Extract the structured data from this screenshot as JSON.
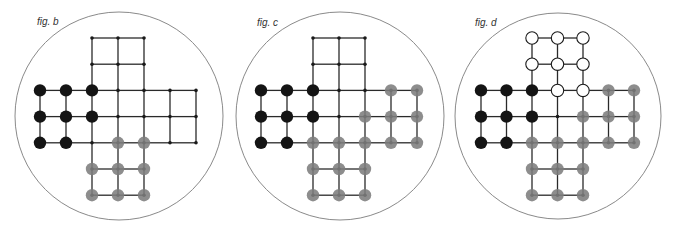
{
  "colors": {
    "background": "#ffffff",
    "circle_outline": "#8a8a8a",
    "line": "#2a2a2a",
    "black_peg": "#141414",
    "gray_peg": "#7d7d7d",
    "white_peg_fill": "#ffffff",
    "white_peg_stroke": "#1a1a1a"
  },
  "board": {
    "description": "Cross-shaped board: 3x3 center plus four 3x2 arms (top, left, right, bottom), each cell point indexed by column c (0-6) and row r (0-6)",
    "points": [
      [
        2,
        0
      ],
      [
        3,
        0
      ],
      [
        4,
        0
      ],
      [
        2,
        1
      ],
      [
        3,
        1
      ],
      [
        4,
        1
      ],
      [
        0,
        2
      ],
      [
        1,
        2
      ],
      [
        2,
        2
      ],
      [
        3,
        2
      ],
      [
        4,
        2
      ],
      [
        5,
        2
      ],
      [
        6,
        2
      ],
      [
        0,
        3
      ],
      [
        1,
        3
      ],
      [
        2,
        3
      ],
      [
        3,
        3
      ],
      [
        4,
        3
      ],
      [
        5,
        3
      ],
      [
        6,
        3
      ],
      [
        0,
        4
      ],
      [
        1,
        4
      ],
      [
        2,
        4
      ],
      [
        3,
        4
      ],
      [
        4,
        4
      ],
      [
        5,
        4
      ],
      [
        6,
        4
      ],
      [
        2,
        5
      ],
      [
        3,
        5
      ],
      [
        4,
        5
      ],
      [
        2,
        6
      ],
      [
        3,
        6
      ],
      [
        4,
        6
      ]
    ]
  },
  "figures": [
    {
      "id": "b",
      "label": "fig. b",
      "circle": {
        "cx": 119,
        "cy": 116,
        "r": 104
      },
      "label_pos": {
        "x": 37,
        "y": 25
      },
      "grid": {
        "x0": 40,
        "y0": 38,
        "dx": 26,
        "dy": 26.2
      },
      "pegs": {
        "black": [
          [
            0,
            2
          ],
          [
            1,
            2
          ],
          [
            2,
            2
          ],
          [
            0,
            3
          ],
          [
            1,
            3
          ],
          [
            2,
            3
          ],
          [
            0,
            4
          ],
          [
            1,
            4
          ]
        ],
        "gray": [
          [
            3,
            4
          ],
          [
            4,
            4
          ],
          [
            2,
            5
          ],
          [
            3,
            5
          ],
          [
            4,
            5
          ],
          [
            2,
            6
          ],
          [
            3,
            6
          ],
          [
            4,
            6
          ]
        ],
        "white": []
      }
    },
    {
      "id": "c",
      "label": "fig. c",
      "circle": {
        "cx": 340,
        "cy": 116,
        "r": 104
      },
      "label_pos": {
        "x": 257,
        "y": 26
      },
      "grid": {
        "x0": 261,
        "y0": 38,
        "dx": 26,
        "dy": 26.2
      },
      "pegs": {
        "black": [
          [
            0,
            2
          ],
          [
            1,
            2
          ],
          [
            2,
            2
          ],
          [
            0,
            3
          ],
          [
            1,
            3
          ],
          [
            2,
            3
          ],
          [
            0,
            4
          ],
          [
            1,
            4
          ]
        ],
        "gray": [
          [
            2,
            4
          ],
          [
            3,
            4
          ],
          [
            2,
            5
          ],
          [
            3,
            5
          ],
          [
            4,
            5
          ],
          [
            2,
            6
          ],
          [
            3,
            6
          ],
          [
            4,
            6
          ],
          [
            5,
            2
          ],
          [
            6,
            2
          ],
          [
            4,
            3
          ],
          [
            5,
            3
          ],
          [
            6,
            3
          ],
          [
            4,
            4
          ],
          [
            5,
            4
          ],
          [
            6,
            4
          ]
        ],
        "white": []
      }
    },
    {
      "id": "d",
      "label": "fig. d",
      "circle": {
        "cx": 558,
        "cy": 116,
        "r": 103
      },
      "label_pos": {
        "x": 475,
        "y": 26
      },
      "grid": {
        "x0": 481,
        "y0": 38,
        "dx": 25.5,
        "dy": 26.2
      },
      "pegs": {
        "black": [
          [
            0,
            2
          ],
          [
            1,
            2
          ],
          [
            2,
            2
          ],
          [
            0,
            3
          ],
          [
            1,
            3
          ],
          [
            2,
            3
          ],
          [
            0,
            4
          ],
          [
            1,
            4
          ]
        ],
        "gray": [
          [
            2,
            4
          ],
          [
            3,
            4
          ],
          [
            2,
            5
          ],
          [
            3,
            5
          ],
          [
            4,
            5
          ],
          [
            2,
            6
          ],
          [
            3,
            6
          ],
          [
            4,
            6
          ],
          [
            5,
            2
          ],
          [
            6,
            2
          ],
          [
            4,
            3
          ],
          [
            5,
            3
          ],
          [
            6,
            3
          ],
          [
            4,
            4
          ],
          [
            5,
            4
          ],
          [
            6,
            4
          ]
        ],
        "white": [
          [
            2,
            0
          ],
          [
            3,
            0
          ],
          [
            4,
            0
          ],
          [
            2,
            1
          ],
          [
            3,
            1
          ],
          [
            4,
            1
          ],
          [
            3,
            2
          ],
          [
            4,
            2
          ]
        ]
      }
    }
  ]
}
